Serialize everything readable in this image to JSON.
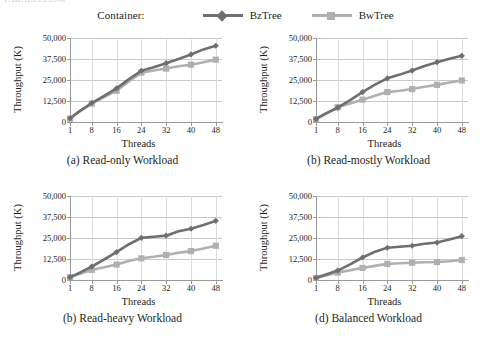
{
  "top_sliver_text": "PARALLELISM",
  "legend": {
    "title": "Container:",
    "entries": [
      {
        "label": "BzTree",
        "color": "#6f6f6f",
        "marker": "diamond"
      },
      {
        "label": "BwTree",
        "color": "#b0b0b0",
        "marker": "square"
      }
    ]
  },
  "axis": {
    "xlabel": "Threads",
    "ylabel": "Throughput (K)",
    "xticks": [
      "1",
      "8",
      "16",
      "24",
      "32",
      "40",
      "48"
    ],
    "yticks": [
      "0",
      "12,500",
      "25,000",
      "37,500",
      "50,000"
    ]
  },
  "chart_data": [
    {
      "type": "line",
      "title": "(a) Read-only Workload",
      "xlabel": "Threads",
      "ylabel": "Throughput (K)",
      "x": [
        1,
        4,
        8,
        12,
        16,
        20,
        24,
        28,
        32,
        36,
        40,
        44,
        48
      ],
      "xlim": [
        1,
        50
      ],
      "ylim": [
        0,
        50000
      ],
      "yticks": [
        0,
        12500,
        25000,
        37500,
        50000
      ],
      "grid": true,
      "legend_position": "top-shared",
      "series": [
        {
          "name": "BzTree",
          "color": "#6f6f6f",
          "marker": "diamond",
          "values": [
            2200,
            6300,
            11300,
            15500,
            20000,
            25500,
            30500,
            32600,
            35000,
            37500,
            40200,
            43200,
            45400
          ]
        },
        {
          "name": "BwTree",
          "color": "#b0b0b0",
          "marker": "square",
          "values": [
            2000,
            6100,
            10900,
            14800,
            18600,
            24200,
            29400,
            30600,
            31800,
            33200,
            34100,
            35600,
            37100
          ]
        }
      ]
    },
    {
      "type": "line",
      "title": "(b) Read-mostly Workload",
      "xlabel": "Threads",
      "ylabel": "Throughput (K)",
      "x": [
        1,
        4,
        8,
        12,
        16,
        20,
        24,
        28,
        32,
        36,
        40,
        44,
        48
      ],
      "xlim": [
        1,
        50
      ],
      "ylim": [
        0,
        50000
      ],
      "yticks": [
        0,
        12500,
        25000,
        37500,
        50000
      ],
      "grid": true,
      "legend_position": "top-shared",
      "series": [
        {
          "name": "BzTree",
          "color": "#6f6f6f",
          "marker": "diamond",
          "values": [
            1800,
            5000,
            8500,
            13000,
            17800,
            22200,
            26000,
            28200,
            30600,
            33300,
            35600,
            37600,
            39400
          ]
        },
        {
          "name": "BwTree",
          "color": "#b0b0b0",
          "marker": "square",
          "values": [
            1700,
            4500,
            8800,
            11000,
            13300,
            15600,
            17800,
            18600,
            19600,
            21000,
            22100,
            23500,
            24700
          ]
        }
      ]
    },
    {
      "type": "line",
      "title": "(b) Read-heavy Workload",
      "xlabel": "Threads",
      "ylabel": "Throughput (K)",
      "x": [
        1,
        4,
        8,
        12,
        16,
        20,
        24,
        28,
        32,
        36,
        40,
        44,
        48
      ],
      "xlim": [
        1,
        50
      ],
      "ylim": [
        0,
        50000
      ],
      "yticks": [
        0,
        12500,
        25000,
        37500,
        50000
      ],
      "grid": true,
      "legend_position": "top-shared",
      "series": [
        {
          "name": "BzTree",
          "color": "#6f6f6f",
          "marker": "diamond",
          "values": [
            1700,
            4200,
            8000,
            12200,
            16600,
            21300,
            25100,
            25700,
            26400,
            29000,
            30500,
            32700,
            35200
          ]
        },
        {
          "name": "BwTree",
          "color": "#b0b0b0",
          "marker": "square",
          "values": [
            1600,
            3500,
            6000,
            7600,
            9200,
            11300,
            12900,
            13800,
            14900,
            16200,
            17200,
            18700,
            20400
          ]
        }
      ]
    },
    {
      "type": "line",
      "title": "(d) Balanced Workload",
      "xlabel": "Threads",
      "ylabel": "Throughput (K)",
      "x": [
        1,
        4,
        8,
        12,
        16,
        20,
        24,
        28,
        32,
        36,
        40,
        44,
        48
      ],
      "xlim": [
        1,
        50
      ],
      "ylim": [
        0,
        50000
      ],
      "yticks": [
        0,
        12500,
        25000,
        37500,
        50000
      ],
      "grid": true,
      "legend_position": "top-shared",
      "series": [
        {
          "name": "BzTree",
          "color": "#6f6f6f",
          "marker": "diamond",
          "values": [
            1300,
            3100,
            5600,
            9300,
            13400,
            16800,
            19200,
            19800,
            20400,
            21600,
            22300,
            24100,
            26100
          ]
        },
        {
          "name": "BwTree",
          "color": "#b0b0b0",
          "marker": "square",
          "values": [
            1200,
            2600,
            4400,
            5800,
            7200,
            8400,
            9600,
            10000,
            10300,
            10600,
            10700,
            11200,
            11900
          ]
        }
      ]
    }
  ]
}
